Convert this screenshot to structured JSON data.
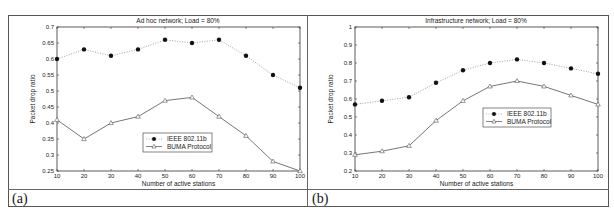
{
  "panels": [
    {
      "label": "(a)"
    },
    {
      "label": "(b)"
    }
  ],
  "chart_data": [
    {
      "type": "line",
      "title": "Ad hoc network; Load = 80%",
      "xlabel": "Number of active stations",
      "ylabel": "Packet drop ratio",
      "x": [
        10,
        20,
        30,
        40,
        50,
        60,
        70,
        80,
        90,
        100
      ],
      "xlim": [
        10,
        100
      ],
      "ylim": [
        0.25,
        0.7
      ],
      "xticks": [
        "10",
        "20",
        "30",
        "40",
        "50",
        "60",
        "70",
        "80",
        "90",
        "100"
      ],
      "yticks": [
        "0.25",
        "0.3",
        "0.35",
        "0.4",
        "0.45",
        "0.5",
        "0.55",
        "0.6",
        "0.65",
        "0.7"
      ],
      "grid": false,
      "legend_position": "center",
      "series": [
        {
          "name": "IEEE 802.11b",
          "style": "dotted, filled circle markers",
          "color": "#111111",
          "values": [
            0.6,
            0.63,
            0.61,
            0.63,
            0.66,
            0.65,
            0.66,
            0.61,
            0.55,
            0.51
          ]
        },
        {
          "name": "BUMA Protocol",
          "style": "solid, triangle markers",
          "color": "#555555",
          "values": [
            0.41,
            0.35,
            0.4,
            0.42,
            0.47,
            0.48,
            0.42,
            0.36,
            0.28,
            0.25
          ]
        }
      ]
    },
    {
      "type": "line",
      "title": "Infrastructure network; Load = 80%",
      "xlabel": "Number of active stations",
      "ylabel": "Packet drop ratio",
      "x": [
        10,
        20,
        30,
        40,
        50,
        60,
        70,
        80,
        90,
        100
      ],
      "xlim": [
        10,
        100
      ],
      "ylim": [
        0.2,
        1.0
      ],
      "xticks": [
        "10",
        "20",
        "30",
        "40",
        "50",
        "60",
        "70",
        "80",
        "90",
        "100"
      ],
      "yticks": [
        "0.2",
        "0.3",
        "0.4",
        "0.5",
        "0.6",
        "0.7",
        "0.8",
        "0.9",
        "1"
      ],
      "grid": false,
      "legend_position": "center-right",
      "series": [
        {
          "name": "IEEE 802.11b",
          "style": "dotted, filled circle markers",
          "color": "#111111",
          "values": [
            0.57,
            0.59,
            0.61,
            0.69,
            0.76,
            0.8,
            0.82,
            0.8,
            0.77,
            0.74
          ]
        },
        {
          "name": "BUMA Protocol",
          "style": "solid, triangle markers",
          "color": "#555555",
          "values": [
            0.29,
            0.31,
            0.34,
            0.48,
            0.59,
            0.67,
            0.7,
            0.67,
            0.62,
            0.57
          ]
        }
      ]
    }
  ]
}
